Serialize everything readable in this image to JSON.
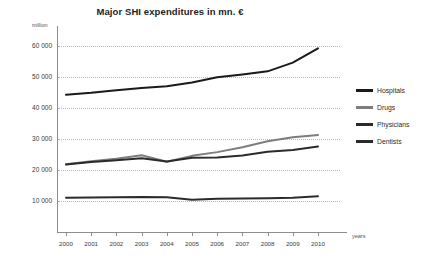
{
  "chart_data": {
    "type": "line",
    "title": "Major SHI expenditures in mn. €",
    "ylabel": "million",
    "xlabel": "years",
    "ylim": [
      0,
      65000
    ],
    "yticks": [
      "10 000",
      "20 000",
      "30 000",
      "40 000",
      "50 000",
      "60 000"
    ],
    "ytick_values": [
      10000,
      20000,
      30000,
      40000,
      50000,
      60000
    ],
    "grid": true,
    "legend_position": "right",
    "categories": [
      "2000",
      "2001",
      "2002",
      "2003",
      "2004",
      "2005",
      "2006",
      "2007",
      "2008",
      "2009",
      "2010"
    ],
    "x": [
      2000,
      2001,
      2002,
      2003,
      2004,
      2005,
      2006,
      2007,
      2008,
      2009,
      2010
    ],
    "series": [
      {
        "name": "Hospitals",
        "color": "#1a1a1a",
        "values": [
          44200,
          44800,
          45600,
          46300,
          46900,
          48100,
          49800,
          50700,
          51700,
          54500,
          59100
        ]
      },
      {
        "name": "Drugs",
        "color": "#7d7d7d",
        "values": [
          21800,
          22800,
          23600,
          24700,
          22600,
          24500,
          25700,
          27300,
          29200,
          30500,
          31200
        ]
      },
      {
        "name": "Physicians",
        "color": "#2b2b2b",
        "values": [
          21700,
          22500,
          23100,
          23700,
          22700,
          23900,
          24000,
          24600,
          25800,
          26400,
          27500
        ]
      },
      {
        "name": "Dentists",
        "color": "#2b2b2b",
        "values": [
          11000,
          11100,
          11200,
          11300,
          11200,
          10400,
          10700,
          10800,
          10900,
          11000,
          11500
        ]
      }
    ]
  }
}
